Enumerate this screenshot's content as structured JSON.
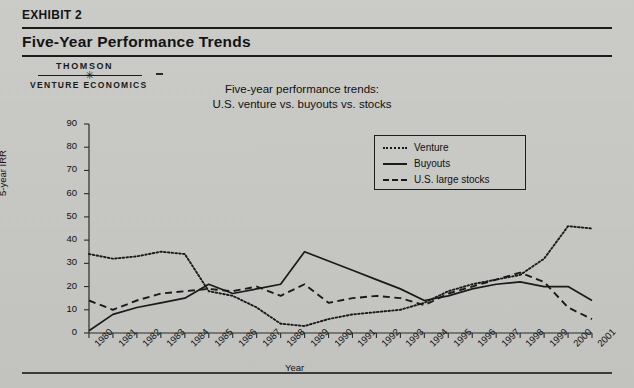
{
  "exhibit": {
    "label": "EXHIBIT 2",
    "title": "Five-Year Performance Trends"
  },
  "logo": {
    "line1": "THOMSON",
    "line2": "VENTURE ECONOMICS",
    "star_glyph": "✳"
  },
  "chart_data": {
    "type": "line",
    "title": "Five-year performance trends:\nU.S. venture vs. buyouts vs. stocks",
    "title_line1": "Five-year performance trends:",
    "title_line2": "U.S. venture vs. buyouts vs. stocks",
    "xlabel": "Year",
    "ylabel": "5-year IRR",
    "ylim": [
      0,
      90
    ],
    "yticks": [
      0,
      10,
      20,
      30,
      40,
      50,
      60,
      70,
      80,
      90
    ],
    "grid": false,
    "legend_position": "upper-right-inside",
    "categories": [
      "1980",
      "1981",
      "1982",
      "1983",
      "1984",
      "1985",
      "1986",
      "1987",
      "1988",
      "1989",
      "1990",
      "1991",
      "1992",
      "1993",
      "1994",
      "1995",
      "1996",
      "1997",
      "1998",
      "1999",
      "2000",
      "2001"
    ],
    "series": [
      {
        "name": "Venture",
        "style": "dotted",
        "color": "#1a1a1a",
        "values": [
          34,
          32,
          33,
          35,
          34,
          18,
          16,
          11,
          4,
          3,
          6,
          8,
          9,
          10,
          13,
          18,
          21,
          23,
          25,
          32,
          46,
          45
        ]
      },
      {
        "name": "Buyouts",
        "style": "solid",
        "color": "#1a1a1a",
        "values": [
          1,
          8,
          11,
          13,
          15,
          21,
          17,
          19,
          21,
          35,
          31,
          27,
          23,
          19,
          14,
          16,
          19,
          21,
          22,
          20,
          20,
          14
        ]
      },
      {
        "name": "U.S. large stocks",
        "style": "dashed",
        "color": "#1a1a1a",
        "values": [
          14,
          10,
          14,
          17,
          18,
          19,
          18,
          20,
          16,
          21,
          13,
          15,
          16,
          15,
          12,
          17,
          20,
          23,
          26,
          22,
          11,
          6
        ]
      }
    ]
  },
  "legend": {
    "items": [
      {
        "label": "Venture",
        "style": "dotted"
      },
      {
        "label": "Buyouts",
        "style": "solid"
      },
      {
        "label": "U.S. large stocks",
        "style": "dashed"
      }
    ]
  }
}
